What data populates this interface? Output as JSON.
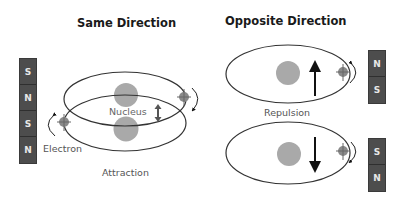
{
  "panels": {
    "left": {
      "title": "Same Direction",
      "nucleus_label": "Nucleus",
      "electron_label": "Electron",
      "caption": "Attraction",
      "magnet_poles": [
        "S",
        "N",
        "S",
        "N"
      ]
    },
    "right": {
      "title": "Opposite Direction",
      "caption": "Repulsion",
      "top_magnet_poles": [
        "N",
        "S"
      ],
      "bottom_magnet_poles": [
        "S",
        "N"
      ]
    }
  },
  "colors": {
    "nucleus": "#a9a9a9",
    "orbit": "#333333",
    "magnet": "#4d4d4d",
    "magnet_text": "#e8e8e8",
    "arrow": "#111111"
  }
}
